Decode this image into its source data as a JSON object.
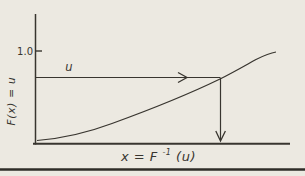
{
  "figure": {
    "colors": {
      "background": "#ece9e1",
      "ink": "#38352f",
      "rule": "#2f2c27"
    },
    "labels": {
      "y_axis": "F(x) = u",
      "y_tick": "1.0",
      "u": "u",
      "x_axis_base": "x = F",
      "x_axis_sup": "-1",
      "x_axis_tail": "(u)"
    }
  }
}
